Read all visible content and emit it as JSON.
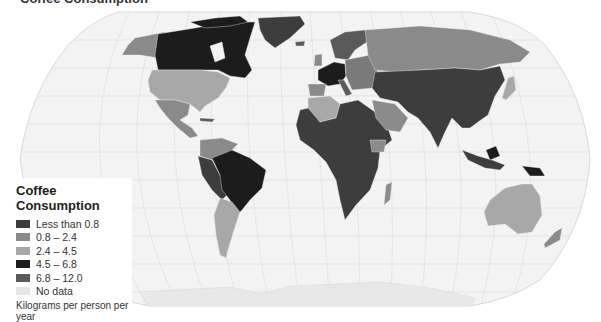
{
  "title": "Coffee Consumption",
  "legend": {
    "title": "Coffee Consumption",
    "items": [
      {
        "label": "Less than 0.8",
        "color": "#3d3d3d"
      },
      {
        "label": "0.8 – 2.4",
        "color": "#8a8a8a"
      },
      {
        "label": "2.4 – 4.5",
        "color": "#a8a8a8"
      },
      {
        "label": "4.5 – 6.8",
        "color": "#1c1c1c"
      },
      {
        "label": "6.8 – 12.0",
        "color": "#5a5a5a"
      },
      {
        "label": "No data",
        "color": "#e6e6e6"
      }
    ],
    "unit_note": "Kilograms per person per year"
  },
  "map": {
    "projection": "Robinson",
    "ocean_color": "#f2f2f2",
    "graticule_color": "#d8d8d8",
    "regions": {
      "canada": "4.5 – 6.8",
      "alaska": "0.8 – 2.4",
      "greenland": "Less than 0.8",
      "usa": "2.4 – 4.5",
      "mexico": "0.8 – 2.4",
      "brazil": "4.5 – 6.8",
      "argentina": "2.4 – 4.5",
      "colombia_venezuela": "0.8 – 2.4",
      "western_europe": "4.5 – 6.8",
      "northern_europe": "6.8 – 12.0",
      "russia": "0.8 – 2.4",
      "africa": "Less than 0.8",
      "algeria": "2.4 – 4.5",
      "saudi_arabia": "0.8 – 2.4",
      "asia": "Less than 0.8",
      "australia": "2.4 – 4.5",
      "new_zealand": "0.8 – 2.4",
      "japan": "2.4 – 4.5",
      "antarctica": "No data"
    }
  }
}
